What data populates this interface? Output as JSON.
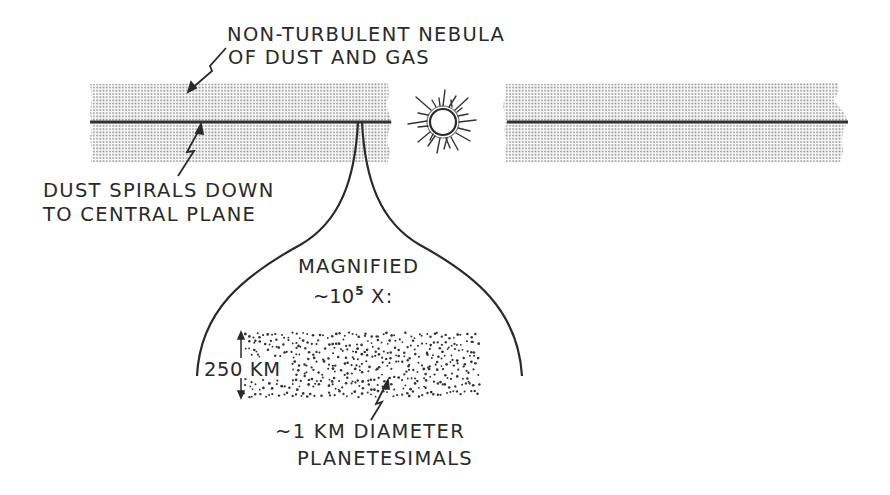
{
  "diagram": {
    "labels": {
      "nebula_line1": "NON-TURBULENT NEBULA",
      "nebula_line2": "OF DUST AND GAS",
      "dust_line1": "DUST SPIRALS DOWN",
      "dust_line2": "TO CENTRAL PLANE",
      "magnified_line1": "MAGNIFIED",
      "magnified_prefix": "~10",
      "magnified_exponent": "5",
      "magnified_suffix": " X:",
      "thickness": "250 KM",
      "planetesimal_line1": "~1 KM DIAMETER",
      "planetesimal_line2": "PLANETESIMALS"
    },
    "elements": {
      "nebula_band_left": {
        "x": 90,
        "y": 83,
        "width": 300,
        "height": 79
      },
      "nebula_band_right": {
        "x": 505,
        "y": 83,
        "width": 343,
        "height": 79
      },
      "central_plane_y": 122,
      "sun": {
        "cx": 443,
        "cy": 122,
        "r": 13,
        "ray_length": 30
      },
      "magnification_bell": {
        "apex_x": 360,
        "apex_y": 122,
        "left_end_x": 197,
        "right_end_x": 522,
        "end_y": 376
      },
      "planetesimal_layer": {
        "x": 243,
        "y": 332,
        "width": 237,
        "height": 66
      }
    },
    "colors": {
      "ink": "#2a2a2a",
      "stipple": "#8a8a8a",
      "background": "#ffffff"
    }
  }
}
